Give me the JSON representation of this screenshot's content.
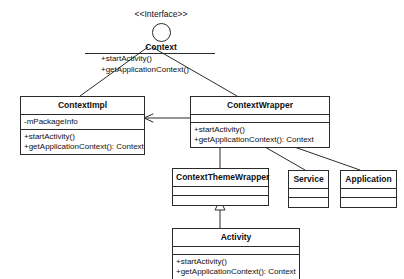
{
  "diagram": {
    "background_color": "#ffffff",
    "line_color": "#2b2b2b",
    "text_color": "#101010"
  },
  "interface": {
    "stereotype": "<<Interface>>",
    "name": "Context",
    "operations": [
      "+startActivity()",
      "+getApplicationContext()"
    ]
  },
  "classes": {
    "context_impl": {
      "name": "ContextImpl",
      "attributes": [
        "-mPackageInfo"
      ],
      "operations": [
        "+startActivity()",
        "+getApplicationContext(): Context"
      ]
    },
    "context_wrapper": {
      "name": "ContextWrapper",
      "attributes": [],
      "operations": [
        "+startActivity()",
        "+getApplicationContext(): Context"
      ]
    },
    "context_theme_wrapper": {
      "name": "ContextThemeWrapper",
      "attributes": [],
      "operations": []
    },
    "service": {
      "name": "Service",
      "attributes": [],
      "operations": []
    },
    "application": {
      "name": "Application",
      "attributes": [],
      "operations": []
    },
    "activity": {
      "name": "Activity",
      "attributes": [],
      "operations": [
        "+startActivity()",
        "+getApplicationContext(): Context"
      ]
    }
  },
  "relationships": [
    {
      "id": "context-to-contextimpl",
      "from": "Context",
      "to": "ContextImpl",
      "type": "realization"
    },
    {
      "id": "context-to-contextwrapper",
      "from": "Context",
      "to": "ContextWrapper",
      "type": "realization"
    },
    {
      "id": "contextwrapper-to-contextimpl",
      "from": "ContextWrapper",
      "to": "ContextImpl",
      "type": "association"
    },
    {
      "id": "contextthemewrapper-to-contextwrapper",
      "from": "ContextThemeWrapper",
      "to": "ContextWrapper",
      "type": "generalization"
    },
    {
      "id": "service-to-contextwrapper",
      "from": "Service",
      "to": "ContextWrapper",
      "type": "generalization"
    },
    {
      "id": "application-to-contextwrapper",
      "from": "Application",
      "to": "ContextWrapper",
      "type": "generalization"
    },
    {
      "id": "activity-to-contextthemewrapper",
      "from": "Activity",
      "to": "ContextThemeWrapper",
      "type": "generalization"
    }
  ]
}
